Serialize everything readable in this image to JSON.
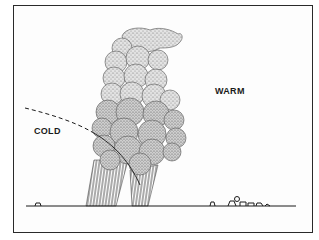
{
  "diagram": {
    "type": "weather-front-illustration",
    "labels": {
      "warm": "WARM",
      "cold": "COLD"
    },
    "elements": [
      {
        "name": "cumulonimbus-cloud",
        "description": "towering stippled storm cloud"
      },
      {
        "name": "cold-front-boundary",
        "description": "dashed curved line marking cold air mass edge"
      },
      {
        "name": "precipitation",
        "description": "vertical hatched rain shafts below cloud"
      },
      {
        "name": "ground-line",
        "description": "horizon line with small buildings and trees"
      }
    ],
    "colors": {
      "ink": "#1a1a1a",
      "stipple": "#8a8a8a",
      "background": "#ffffff"
    }
  }
}
